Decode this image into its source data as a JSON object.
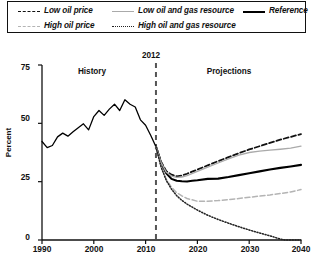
{
  "legend": {
    "items": [
      {
        "label": "Low oil price",
        "style": "dashed",
        "color": "#111111",
        "row": 0,
        "col": 0
      },
      {
        "label": "Low oil and gas resource",
        "style": "solid",
        "color": "#aaaaaa",
        "row": 0,
        "col": 1
      },
      {
        "label": "Reference",
        "style": "solid-thick",
        "color": "#000000",
        "row": 0,
        "col": 2
      },
      {
        "label": "High oil price",
        "style": "dashed",
        "color": "#b4b4b4",
        "row": 1,
        "col": 0
      },
      {
        "label": "High oil and gas resource",
        "style": "dotted",
        "color": "#222222",
        "row": 1,
        "col": 1
      }
    ]
  },
  "annotations": {
    "history": "History",
    "projections": "Projections",
    "divider_year": "2012"
  },
  "chart_data": {
    "type": "line",
    "title": "",
    "xlabel": "",
    "ylabel": "Percent",
    "xlim": [
      1990,
      2040
    ],
    "ylim": [
      0,
      75
    ],
    "yticks": [
      0,
      25,
      50,
      75
    ],
    "xticks": [
      1990,
      2000,
      2010,
      2020,
      2030,
      2040
    ],
    "grid": false,
    "legend_position": "top",
    "divider_x": 2012,
    "divider_label": "2012",
    "region_labels": {
      "left": "History",
      "right": "Projections"
    },
    "series": [
      {
        "name": "History",
        "style": "solid",
        "color": "#000000",
        "width": 1.3,
        "x": [
          1990,
          1991,
          1992,
          1993,
          1994,
          1995,
          1996,
          1997,
          1998,
          1999,
          2000,
          2001,
          2002,
          2003,
          2004,
          2005,
          2006,
          2007,
          2008,
          2009,
          2010,
          2011,
          2012
        ],
        "values": [
          42.2,
          39.6,
          40.5,
          44.2,
          45.8,
          44.5,
          46.4,
          48.1,
          49.8,
          47.2,
          52.9,
          55.5,
          53.4,
          56.1,
          58.2,
          55.5,
          60.1,
          58.2,
          57.0,
          51.5,
          49.2,
          44.8,
          40.0
        ]
      },
      {
        "name": "Reference",
        "style": "solid-thick",
        "color": "#000000",
        "width": 2.1,
        "x": [
          2012,
          2013,
          2014,
          2015,
          2016,
          2017,
          2018,
          2019,
          2020,
          2022,
          2024,
          2026,
          2028,
          2030,
          2032,
          2034,
          2036,
          2038,
          2040
        ],
        "values": [
          40.0,
          33.0,
          28.6,
          26.2,
          25.4,
          25.2,
          25.1,
          25.4,
          25.6,
          26.2,
          26.3,
          27.0,
          27.8,
          28.6,
          29.4,
          30.2,
          30.9,
          31.5,
          32.2
        ]
      },
      {
        "name": "Low oil price",
        "style": "dashed",
        "color": "#111111",
        "width": 1.8,
        "x": [
          2012,
          2013,
          2014,
          2015,
          2016,
          2017,
          2018,
          2020,
          2022,
          2024,
          2026,
          2028,
          2030,
          2032,
          2034,
          2036,
          2038,
          2040
        ],
        "values": [
          40.0,
          33.4,
          29.5,
          28.0,
          27.3,
          27.6,
          28.4,
          30.2,
          32.0,
          33.8,
          35.5,
          37.2,
          38.8,
          40.2,
          41.6,
          43.0,
          44.2,
          45.4
        ]
      },
      {
        "name": "Low oil and gas resource",
        "style": "solid",
        "color": "#aaaaaa",
        "width": 1.3,
        "x": [
          2012,
          2013,
          2014,
          2015,
          2016,
          2017,
          2018,
          2020,
          2022,
          2024,
          2026,
          2028,
          2030,
          2032,
          2034,
          2036,
          2038,
          2040
        ],
        "values": [
          40.0,
          33.2,
          29.0,
          27.4,
          26.8,
          27.0,
          27.6,
          29.4,
          31.2,
          33.0,
          34.8,
          36.4,
          37.5,
          38.1,
          38.5,
          38.9,
          39.4,
          40.2
        ]
      },
      {
        "name": "High oil price",
        "style": "dashed",
        "color": "#b4b4b4",
        "width": 1.5,
        "x": [
          2012,
          2013,
          2014,
          2015,
          2016,
          2017,
          2018,
          2020,
          2022,
          2024,
          2026,
          2028,
          2030,
          2032,
          2034,
          2036,
          2038,
          2040
        ],
        "values": [
          40.0,
          31.6,
          26.0,
          22.6,
          20.3,
          18.9,
          17.8,
          16.6,
          16.6,
          16.9,
          17.3,
          17.8,
          18.3,
          18.8,
          19.3,
          19.9,
          20.6,
          21.6
        ]
      },
      {
        "name": "High oil and gas resource",
        "style": "dotted",
        "color": "#222222",
        "width": 1.5,
        "x": [
          2012,
          2013,
          2014,
          2015,
          2016,
          2017,
          2018,
          2020,
          2022,
          2024,
          2026,
          2028,
          2030,
          2032,
          2034,
          2036,
          2037,
          2038,
          2040
        ],
        "values": [
          40.0,
          31.2,
          25.5,
          21.8,
          19.0,
          17.0,
          15.4,
          12.8,
          10.6,
          8.8,
          7.2,
          5.7,
          4.3,
          3.0,
          1.8,
          0.4,
          0.0,
          0.0,
          0.0
        ]
      }
    ]
  }
}
